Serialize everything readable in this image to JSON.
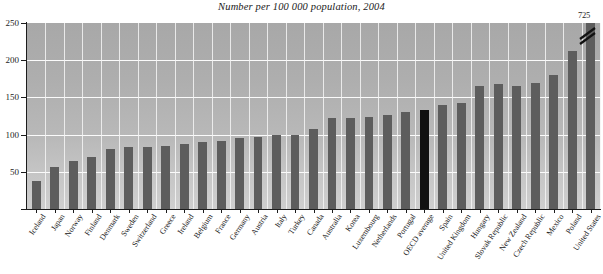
{
  "chart_data": {
    "type": "bar",
    "title": "Number per 100 000 population, 2004",
    "subtitle": "",
    "xlabel": "",
    "ylabel": "",
    "ylim": [
      0,
      250
    ],
    "ytick_values": [
      0,
      50,
      100,
      150,
      200,
      250
    ],
    "ytick_labels": [
      "",
      "50",
      "100",
      "150",
      "200",
      "250"
    ],
    "grid": "horizontal-and-vertical",
    "legend_position": "none",
    "categories": [
      "Iceland",
      "Japan",
      "Norway",
      "Finland",
      "Denmark",
      "Sweden",
      "Switzerland",
      "Greece",
      "Ireland",
      "Belgium",
      "France",
      "Germany",
      "Austria",
      "Italy",
      "Turkey",
      "Canada",
      "Australia",
      "Korea",
      "Luxembourg",
      "Netherlands",
      "Portugal",
      "OECD average",
      "Spain",
      "United Kingdom",
      "Hungary",
      "Slovak Republic",
      "New Zealand",
      "Czech Republic",
      "Mexico",
      "Poland",
      "United States"
    ],
    "values": [
      37,
      57,
      65,
      70,
      81,
      83,
      83,
      85,
      88,
      90,
      92,
      96,
      97,
      99,
      100,
      107,
      123,
      123,
      124,
      126,
      131,
      133,
      140,
      142,
      165,
      168,
      166,
      170,
      180,
      213,
      725
    ],
    "displayed_values": [
      37,
      57,
      65,
      70,
      81,
      83,
      83,
      85,
      88,
      90,
      92,
      96,
      97,
      99,
      100,
      107,
      123,
      123,
      124,
      126,
      131,
      133,
      140,
      142,
      165,
      168,
      166,
      170,
      180,
      213,
      250
    ],
    "highlight_category": "OECD average",
    "annotations": [
      {
        "category": "United States",
        "text": "725",
        "note": "bar truncated at axis maximum, break mark drawn"
      }
    ]
  },
  "style": {
    "bar_color": "#5d5d5d",
    "highlight_bar_color": "#111111",
    "plot_background_top": "#a8a8a8",
    "plot_background_bottom": "#cfcfcf",
    "gridline_color": "#fbfbfb",
    "axis_color": "#1c1c1c",
    "text_color": "#1a1a1a"
  }
}
